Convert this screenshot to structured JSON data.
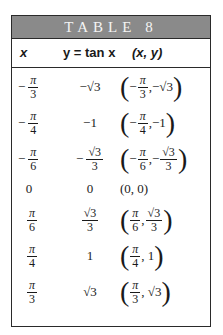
{
  "title": "TABLE 8",
  "headers": [
    "x",
    "y = tan x",
    "(x, y)"
  ],
  "rows": [
    {
      "x": "−π/3",
      "y": "−√3",
      "pair": "(−π/3, −√3)"
    },
    {
      "x": "−π/4",
      "y": "−1",
      "pair": "(−π/4, −1)"
    },
    {
      "x": "−π/6",
      "y": "−√3/3",
      "pair": "(−π/6, −√3/3)"
    },
    {
      "x": "0",
      "y": "0",
      "pair": "(0, 0)"
    },
    {
      "x": "π/6",
      "y": "√3/3",
      "pair": "(π/6, √3/3)"
    },
    {
      "x": "π/4",
      "y": "1",
      "pair": "(π/4, 1)"
    },
    {
      "x": "π/3",
      "y": "√3",
      "pair": "(π/3, √3)"
    }
  ],
  "colors": {
    "title_bar": "#8a8a8a",
    "border": "#2a2a2a"
  }
}
